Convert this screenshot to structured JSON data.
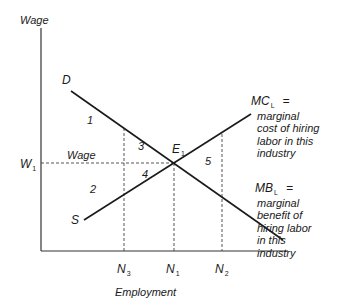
{
  "axes": {
    "y_label": "Wage",
    "x_label": "Employment"
  },
  "curves": {
    "demand_label": "D",
    "supply_label": "S"
  },
  "points": {
    "equilibrium": {
      "main": "E",
      "sub": "1"
    }
  },
  "y_ticks": {
    "w1": {
      "main": "W",
      "sub": "1"
    }
  },
  "x_ticks": [
    {
      "main": "N",
      "sub": "3"
    },
    {
      "main": "N",
      "sub": "1"
    },
    {
      "main": "N",
      "sub": "2"
    }
  ],
  "wage_line_label": "Wage",
  "regions": [
    "1",
    "2",
    "3",
    "4",
    "5"
  ],
  "annotations": {
    "mc": {
      "symbol": "MC",
      "sub": "L",
      "eq": "=",
      "lines": [
        "marginal",
        "cost of hiring",
        "labor in this",
        "industry"
      ]
    },
    "mb": {
      "symbol": "MB",
      "sub": "L",
      "eq": "=",
      "lines": [
        "marginal",
        "benefit of",
        "hiring labor",
        "in this",
        "industry"
      ]
    }
  },
  "colors": {
    "line": "#1a1a1a",
    "background": "#ffffff"
  }
}
